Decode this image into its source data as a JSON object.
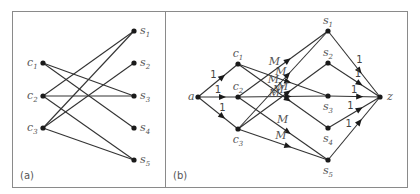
{
  "figure": {
    "panel_a": {
      "label": "(a)",
      "nodes": {
        "c1": {
          "name": "c",
          "sub": "1",
          "x": 43,
          "y": 63
        },
        "c2": {
          "name": "c",
          "sub": "2",
          "x": 43,
          "y": 96
        },
        "c3": {
          "name": "c",
          "sub": "3",
          "x": 43,
          "y": 128
        },
        "s1": {
          "name": "s",
          "sub": "1",
          "x": 134,
          "y": 31
        },
        "s2": {
          "name": "s",
          "sub": "2",
          "x": 134,
          "y": 63
        },
        "s3": {
          "name": "s",
          "sub": "3",
          "x": 134,
          "y": 96
        },
        "s4": {
          "name": "s",
          "sub": "4",
          "x": 134,
          "y": 128
        },
        "s5": {
          "name": "s",
          "sub": "5",
          "x": 134,
          "y": 160
        }
      },
      "edges": [
        [
          "c1",
          "s3"
        ],
        [
          "c1",
          "s4"
        ],
        [
          "c2",
          "s1"
        ],
        [
          "c2",
          "s3"
        ],
        [
          "c2",
          "s5"
        ],
        [
          "c3",
          "s1"
        ],
        [
          "c3",
          "s2"
        ],
        [
          "c3",
          "s5"
        ]
      ]
    },
    "panel_b": {
      "label": "(b)",
      "nodes": {
        "a": {
          "name": "a",
          "sub": "",
          "x": 198,
          "y": 97
        },
        "c1": {
          "name": "c",
          "sub": "1",
          "x": 238,
          "y": 64
        },
        "c2": {
          "name": "c",
          "sub": "2",
          "x": 238,
          "y": 97
        },
        "c3": {
          "name": "c",
          "sub": "3",
          "x": 238,
          "y": 129
        },
        "s1": {
          "name": "s",
          "sub": "1",
          "x": 328,
          "y": 31
        },
        "s2": {
          "name": "s",
          "sub": "2",
          "x": 328,
          "y": 63
        },
        "s3": {
          "name": "s",
          "sub": "3",
          "x": 328,
          "y": 96
        },
        "s4": {
          "name": "s",
          "sub": "4",
          "x": 328,
          "y": 128
        },
        "s5": {
          "name": "s",
          "sub": "5",
          "x": 328,
          "y": 160
        },
        "z": {
          "name": "z",
          "sub": "",
          "x": 380,
          "y": 97
        }
      },
      "edges": [
        {
          "from": "a",
          "to": "c1",
          "cap": "1"
        },
        {
          "from": "a",
          "to": "c2",
          "cap": "1"
        },
        {
          "from": "a",
          "to": "c3",
          "cap": "1"
        },
        {
          "from": "c1",
          "to": "s3",
          "cap": "M"
        },
        {
          "from": "c1",
          "to": "s4",
          "cap": "M"
        },
        {
          "from": "c2",
          "to": "s1",
          "cap": "M"
        },
        {
          "from": "c2",
          "to": "s3",
          "cap": "M"
        },
        {
          "from": "c2",
          "to": "s5",
          "cap": "M"
        },
        {
          "from": "c3",
          "to": "s1",
          "cap": "M"
        },
        {
          "from": "c3",
          "to": "s2",
          "cap": "M"
        },
        {
          "from": "c3",
          "to": "s5",
          "cap": "M"
        },
        {
          "from": "s1",
          "to": "z",
          "cap": "1"
        },
        {
          "from": "s2",
          "to": "z",
          "cap": "1"
        },
        {
          "from": "s3",
          "to": "z",
          "cap": "1"
        },
        {
          "from": "s4",
          "to": "z",
          "cap": "1"
        },
        {
          "from": "s5",
          "to": "z",
          "cap": "1"
        }
      ]
    }
  }
}
